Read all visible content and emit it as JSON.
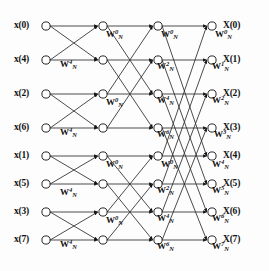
{
  "figure": {
    "kind": "signal-flow-graph",
    "stages": 3,
    "points": 8,
    "line_color": "#1a1a1a",
    "node_fill": "#ffffff",
    "background": "#fdfdfd"
  },
  "inputs": [
    {
      "label": "x(0)",
      "index": 0,
      "y": 26
    },
    {
      "label": "x(4)",
      "index": 4,
      "y": 60
    },
    {
      "label": "x(2)",
      "index": 2,
      "y": 94
    },
    {
      "label": "x(6)",
      "index": 6,
      "y": 128
    },
    {
      "label": "x(1)",
      "index": 1,
      "y": 156
    },
    {
      "label": "x(5)",
      "index": 5,
      "y": 184
    },
    {
      "label": "x(3)",
      "index": 3,
      "y": 212
    },
    {
      "label": "x(7)",
      "index": 7,
      "y": 240
    }
  ],
  "outputs": [
    {
      "label": "X(0)",
      "index": 0,
      "y": 26
    },
    {
      "label": "X(1)",
      "index": 1,
      "y": 60
    },
    {
      "label": "X(2)",
      "index": 2,
      "y": 94
    },
    {
      "label": "X(3)",
      "index": 3,
      "y": 128
    },
    {
      "label": "X(4)",
      "index": 4,
      "y": 156
    },
    {
      "label": "X(5)",
      "index": 5,
      "y": 184
    },
    {
      "label": "X(6)",
      "index": 6,
      "y": 212
    },
    {
      "label": "X(7)",
      "index": 7,
      "y": 240
    }
  ],
  "columns": {
    "input_x": 46,
    "stage1_x": 103,
    "stage2_x": 158,
    "stage3_x": 212
  },
  "twiddles": {
    "symbol": "W",
    "subscript": "N",
    "stage1": [
      {
        "exp": "0",
        "x": 106,
        "y": 32
      },
      {
        "exp": "4",
        "x": 60,
        "y": 62
      },
      {
        "exp": "0",
        "x": 106,
        "y": 100
      },
      {
        "exp": "4",
        "x": 60,
        "y": 130
      },
      {
        "exp": "0",
        "x": 106,
        "y": 162
      },
      {
        "exp": "4",
        "x": 60,
        "y": 190
      },
      {
        "exp": "0",
        "x": 106,
        "y": 218
      },
      {
        "exp": "4",
        "x": 60,
        "y": 242
      }
    ],
    "stage2": [
      {
        "exp": "0",
        "x": 161,
        "y": 32
      },
      {
        "exp": "2",
        "x": 157,
        "y": 64
      },
      {
        "exp": "4",
        "x": 157,
        "y": 98
      },
      {
        "exp": "6",
        "x": 157,
        "y": 132
      },
      {
        "exp": "0",
        "x": 161,
        "y": 162
      },
      {
        "exp": "2",
        "x": 157,
        "y": 188
      },
      {
        "exp": "4",
        "x": 157,
        "y": 216
      },
      {
        "exp": "6",
        "x": 157,
        "y": 244
      }
    ],
    "stage3": [
      {
        "exp": "0",
        "x": 215,
        "y": 32
      },
      {
        "exp": "1",
        "x": 212,
        "y": 64
      },
      {
        "exp": "2",
        "x": 212,
        "y": 98
      },
      {
        "exp": "3",
        "x": 214,
        "y": 132
      },
      {
        "exp": "4",
        "x": 212,
        "y": 162
      },
      {
        "exp": "5",
        "x": 212,
        "y": 188
      },
      {
        "exp": "6",
        "x": 212,
        "y": 216
      },
      {
        "exp": "7",
        "x": 212,
        "y": 244
      }
    ]
  },
  "edges_note": {
    "stage1_pairs": "(0,1) (2,3) (4,5) (6,7) — span 1",
    "stage2_pairs": "(0,2) (1,3) (4,6) (5,7) — span 2",
    "stage3_pairs": "(0,4) (1,5) (2,6) (3,7) — span 4"
  }
}
